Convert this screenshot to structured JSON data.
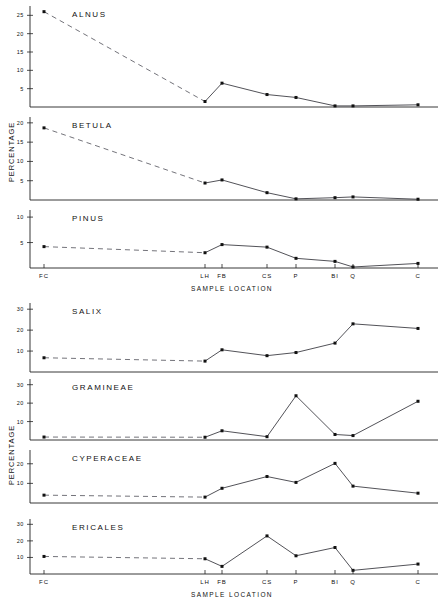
{
  "figure": {
    "background_color": "#ffffff",
    "line_color": "#33333a",
    "marker_color": "#111111",
    "axis_color": "#222222"
  },
  "groups": [
    {
      "name": "upper-group",
      "y_axis_title": "PERCENTAGE",
      "x_axis_title": "SAMPLE LOCATION",
      "x_tick_labels": [
        "FC",
        "LH",
        "FB",
        "CS",
        "P",
        "BI",
        "Q",
        "C"
      ],
      "panels": [
        "ALNUS",
        "BETULA",
        "PINUS"
      ]
    },
    {
      "name": "lower-group",
      "y_axis_title": "PERCENTAGE",
      "x_axis_title": "SAMPLE LOCATION",
      "x_tick_labels": [
        "FC",
        "LH",
        "FB",
        "CS",
        "P",
        "BI",
        "Q",
        "C"
      ],
      "panels": [
        "SALIX",
        "GRAMINEAE",
        "CYPERACEAE",
        "ERICALES"
      ]
    }
  ],
  "chart_data": {
    "type": "line",
    "title": "",
    "xlabel": "SAMPLE LOCATION",
    "ylabel": "PERCENTAGE",
    "grid": false,
    "legend": "none",
    "x": [
      "FC",
      "LH",
      "FB",
      "CS",
      "P",
      "BI",
      "Q",
      "C"
    ],
    "x_tick_labels": [
      "FC",
      "LH",
      "FB",
      "CS",
      "P",
      "BI",
      "Q",
      "C"
    ],
    "note": "Seven stacked single-series line panels; the segment between FC and LH is drawn dashed in every panel to indicate a sampling gap.",
    "panels": [
      {
        "name": "ALNUS",
        "ylabel": "PERCENTAGE",
        "ylim": [
          0,
          27
        ],
        "yticks": [
          5,
          10,
          15,
          20,
          25
        ],
        "values": [
          26.0,
          1.5,
          6.5,
          3.4,
          2.6,
          0.3,
          0.3,
          0.6
        ],
        "dashed_from_index": 0,
        "dashed_to_index": 1
      },
      {
        "name": "BETULA",
        "ylabel": "PERCENTAGE",
        "ylim": [
          0,
          21
        ],
        "yticks": [
          5,
          10,
          15,
          20
        ],
        "values": [
          18.7,
          4.4,
          5.2,
          1.9,
          0.3,
          0.6,
          0.8,
          0.2
        ],
        "dashed_from_index": 0,
        "dashed_to_index": 1
      },
      {
        "name": "PINUS",
        "ylabel": "PERCENTAGE",
        "ylim": [
          0,
          11
        ],
        "yticks": [
          5,
          10
        ],
        "values": [
          4.2,
          3.0,
          4.6,
          4.1,
          1.9,
          1.3,
          0.2,
          0.9
        ],
        "dashed_from_index": 0,
        "dashed_to_index": 1
      },
      {
        "name": "SALIX",
        "ylabel": "PERCENTAGE",
        "ylim": [
          0,
          32
        ],
        "yticks": [
          10,
          20,
          30
        ],
        "values": [
          6.8,
          5.2,
          10.6,
          7.8,
          9.3,
          13.8,
          23.0,
          20.8
        ],
        "dashed_from_index": 0,
        "dashed_to_index": 1
      },
      {
        "name": "GRAMINEAE",
        "ylabel": "PERCENTAGE",
        "ylim": [
          0,
          32
        ],
        "yticks": [
          10,
          20,
          30
        ],
        "values": [
          1.6,
          1.5,
          5.0,
          1.8,
          24.0,
          3.0,
          2.4,
          21.0
        ],
        "dashed_from_index": 0,
        "dashed_to_index": 1
      },
      {
        "name": "CYPERACEAE",
        "ylabel": "PERCENTAGE",
        "ylim": [
          0,
          26
        ],
        "yticks": [
          10,
          20
        ],
        "values": [
          4.0,
          3.0,
          7.5,
          13.5,
          10.5,
          20.2,
          8.6,
          5.0
        ],
        "dashed_from_index": 0,
        "dashed_to_index": 1
      },
      {
        "name": "ERICALES",
        "ylabel": "PERCENTAGE",
        "ylim": [
          0,
          32
        ],
        "yticks": [
          10,
          20,
          30
        ],
        "values": [
          10.6,
          9.2,
          4.6,
          23.0,
          11.0,
          16.0,
          2.2,
          6.0
        ],
        "dashed_from_index": 0,
        "dashed_to_index": 1
      }
    ]
  }
}
